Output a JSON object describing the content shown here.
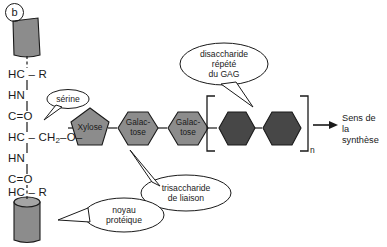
{
  "figure": {
    "panel_letter": "b"
  },
  "protein": {
    "core_top_shape": "protein-core-ribbon-top",
    "core_bottom_shape": "protein-core-cylinder-bottom",
    "chain": [
      {
        "id": "r1",
        "text": "HC – R"
      },
      {
        "id": "hn1",
        "text": "HN"
      },
      {
        "id": "co1",
        "text": "C=O"
      },
      {
        "id": "ser",
        "text": "HC – CH"
      },
      {
        "id": "ser_sub",
        "text": "2"
      },
      {
        "id": "ser_tail",
        "text": "–O–"
      },
      {
        "id": "hn2",
        "text": "HN"
      },
      {
        "id": "co2",
        "text": "C=O"
      },
      {
        "id": "r2",
        "text": "HC – R"
      }
    ]
  },
  "sugars": [
    {
      "id": "xylose",
      "label": "Xylose",
      "shape": "pentagon",
      "color": "#8c8c8c"
    },
    {
      "id": "galactose1",
      "label": "Galac-\ntose",
      "shape": "hexagon",
      "color": "#8c8c8c"
    },
    {
      "id": "galactose2",
      "label": "Galac-\ntose",
      "shape": "hexagon",
      "color": "#8c8c8c"
    },
    {
      "id": "gag1",
      "label": "",
      "shape": "hexagon",
      "color": "#474747"
    },
    {
      "id": "gag2",
      "label": "",
      "shape": "hexagon",
      "color": "#474747"
    }
  ],
  "repeat_unit": {
    "subscript": "n"
  },
  "callouts": [
    {
      "id": "serine",
      "text": "sérine"
    },
    {
      "id": "disaccharide",
      "text": "disaccharide\nrépété\ndu GAG"
    },
    {
      "id": "trisaccharide",
      "text": "trisaccharide\nde liaison"
    },
    {
      "id": "noyau",
      "text": "noyau\nprotéique"
    }
  ],
  "direction_arrow": {
    "label": "Sens de\nla synthèse"
  },
  "colors": {
    "ink": "#1a1a1a",
    "sugar_light": "#8c8c8c",
    "sugar_dark": "#474747",
    "protein_fill": "#8c8c8c",
    "background": "#ffffff"
  }
}
